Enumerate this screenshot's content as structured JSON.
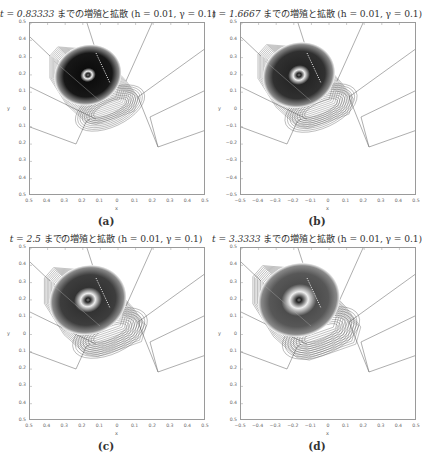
{
  "figure": {
    "panels": [
      {
        "id": "a",
        "title_t": "t = 0.83333",
        "title_rest": " までの増殖と拡散 (h = 0.01, γ = 0.1)",
        "caption": "(a)",
        "xlabel": "x",
        "ylabel": "y",
        "xticks": [
          "0.5",
          "0.4",
          "0.3",
          "0.2",
          "0.1",
          "0",
          "0.1",
          "0.2",
          "0.3",
          "0.4",
          "0.5"
        ],
        "yticks": [
          "0.5",
          "0.4",
          "0.3",
          "0.2",
          "0.1",
          "0",
          "0.1",
          "0.2",
          "0.3",
          "0.4",
          "0.5"
        ],
        "darkness": 0.95,
        "ring": 0.05,
        "spread": 1.0
      },
      {
        "id": "b",
        "title_t": "t = 1.6667",
        "title_rest": " までの増殖と拡散 (h = 0.01, γ = 0.1)",
        "caption": "(b)",
        "xlabel": "x",
        "ylabel": "y",
        "xticks": [
          "−0.5",
          "−0.4",
          "−0.3",
          "−0.2",
          "−0.1",
          "0",
          "0.1",
          "0.2",
          "0.3",
          "0.4",
          "0.5"
        ],
        "yticks": [
          "0.5",
          "0.4",
          "0.3",
          "0.2",
          "0.1",
          "0",
          "−0.1",
          "−0.2",
          "−0.3",
          "−0.4",
          "−0.5"
        ],
        "darkness": 0.85,
        "ring": 0.12,
        "spread": 1.08
      },
      {
        "id": "c",
        "title_t": "t = 2.5",
        "title_rest": " までの増殖と拡散 (h = 0.01, γ = 0.1)",
        "caption": "(c)",
        "xlabel": "x",
        "ylabel": "y",
        "xticks": [
          "0.5",
          "0.4",
          "0.3",
          "0.2",
          "0.1",
          "0",
          "0.1",
          "0.2",
          "0.3",
          "0.4",
          "0.5"
        ],
        "yticks": [
          "0.5",
          "0.4",
          "0.3",
          "0.2",
          "0.1",
          "0",
          "0.1",
          "0.2",
          "0.3",
          "0.4",
          "0.5"
        ],
        "darkness": 0.8,
        "ring": 0.18,
        "spread": 1.15
      },
      {
        "id": "d",
        "title_t": "t = 3.3333",
        "title_rest": " までの増殖と拡散 (h = 0.01, γ = 0.1)",
        "caption": "(d)",
        "xlabel": "x",
        "ylabel": "y",
        "xticks": [
          "−0.5",
          "−0.4",
          "−0.3",
          "−0.2",
          "−0.1",
          "0",
          "0.1",
          "0.2",
          "0.3",
          "0.4",
          "0.5"
        ],
        "yticks": [
          "0.5",
          "0.4",
          "0.3",
          "0.2",
          "0.1",
          "0",
          "0.1",
          "0.2",
          "0.3",
          "0.4",
          "0.5"
        ],
        "darkness": 0.7,
        "ring": 0.25,
        "spread": 1.22
      }
    ]
  },
  "chart_data": [
    {
      "type": "heatmap",
      "title": "t = 0.83333 までの増殖と拡散 (h = 0.01, γ = 0.1)",
      "xlabel": "x",
      "ylabel": "y",
      "xlim": [
        -0.5,
        0.5
      ],
      "ylim": [
        -0.5,
        0.5
      ],
      "caption": "(a)",
      "description": "Contour plot of concentration; dense dark core near (-0.15, 0.16) with Voronoi-like boundary lines",
      "peak_center": [
        -0.15,
        0.16
      ]
    },
    {
      "type": "heatmap",
      "title": "t = 1.6667 までの増殖と拡散 (h = 0.01, γ = 0.1)",
      "xlabel": "x",
      "ylabel": "y",
      "xlim": [
        -0.5,
        0.5
      ],
      "ylim": [
        -0.5,
        0.5
      ],
      "caption": "(b)",
      "peak_center": [
        -0.15,
        0.16
      ]
    },
    {
      "type": "heatmap",
      "title": "t = 2.5 までの増殖と拡散 (h = 0.01, γ = 0.1)",
      "xlabel": "x",
      "ylabel": "y",
      "xlim": [
        -0.5,
        0.5
      ],
      "ylim": [
        -0.5,
        0.5
      ],
      "caption": "(c)",
      "peak_center": [
        -0.15,
        0.16
      ]
    },
    {
      "type": "heatmap",
      "title": "t = 3.3333 までの増殖と拡散 (h = 0.01, γ = 0.1)",
      "xlabel": "x",
      "ylabel": "y",
      "xlim": [
        -0.5,
        0.5
      ],
      "ylim": [
        -0.5,
        0.5
      ],
      "caption": "(d)",
      "peak_center": [
        -0.15,
        0.16
      ]
    }
  ]
}
